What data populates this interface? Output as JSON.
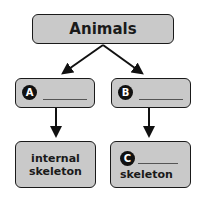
{
  "diagram": {
    "root": {
      "label": "Animals"
    },
    "branches": [
      {
        "marker": "A",
        "blank": "_____",
        "child": {
          "label_line1": "internal",
          "label_line2": "skeleton"
        }
      },
      {
        "marker": "B",
        "blank": "_____",
        "child": {
          "marker": "C",
          "blank": "_____",
          "label": "skeleton"
        }
      }
    ],
    "colors": {
      "box_fill": "#c9c9c9",
      "border": "#1a1a1a",
      "marker_fill": "#111111"
    }
  }
}
